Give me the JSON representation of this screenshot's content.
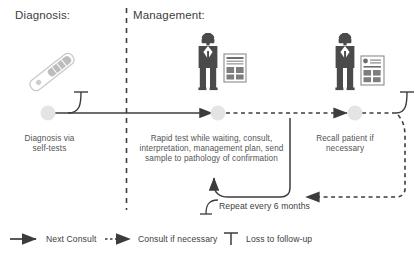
{
  "figure": {
    "title_diagnosis": "Diagnosis:",
    "title_management": "Management:",
    "divider": "dashed-vertical-divider",
    "background": "#ffffff",
    "line_color": "#3c3c3c",
    "node_color": "#e3e3e3",
    "icon_color": "#4a4a4a",
    "test_kit_color": "#cfcfcf"
  },
  "nodes": [
    {
      "id": "node-diagnosis",
      "x": 48,
      "y": 113,
      "caption": "Diagnosis via\nself-tests",
      "icon": "self-test-kit-icon"
    },
    {
      "id": "node-first-consult",
      "x": 218,
      "y": 113,
      "caption": "Rapid test while waiting, consult,\ninterpretation, management plan, send\nsample to pathology of confirmation",
      "icon": "doctor-with-report-icon"
    },
    {
      "id": "node-recall",
      "x": 355,
      "y": 113,
      "caption": "Recall patient if\nnecessary",
      "icon": "doctor-with-report-icon"
    }
  ],
  "annotations": {
    "repeat_loop": "Repeat every 6 months"
  },
  "legend": [
    {
      "id": "legend-next-consult",
      "marker": "solid-arrow-icon",
      "label": "Next Consult"
    },
    {
      "id": "legend-consult-if-necessary",
      "marker": "dotted-arrow-icon",
      "label": "Consult if necessary"
    },
    {
      "id": "legend-loss-to-followup",
      "marker": "t-bar-icon",
      "label": "Loss to follow-up"
    }
  ]
}
